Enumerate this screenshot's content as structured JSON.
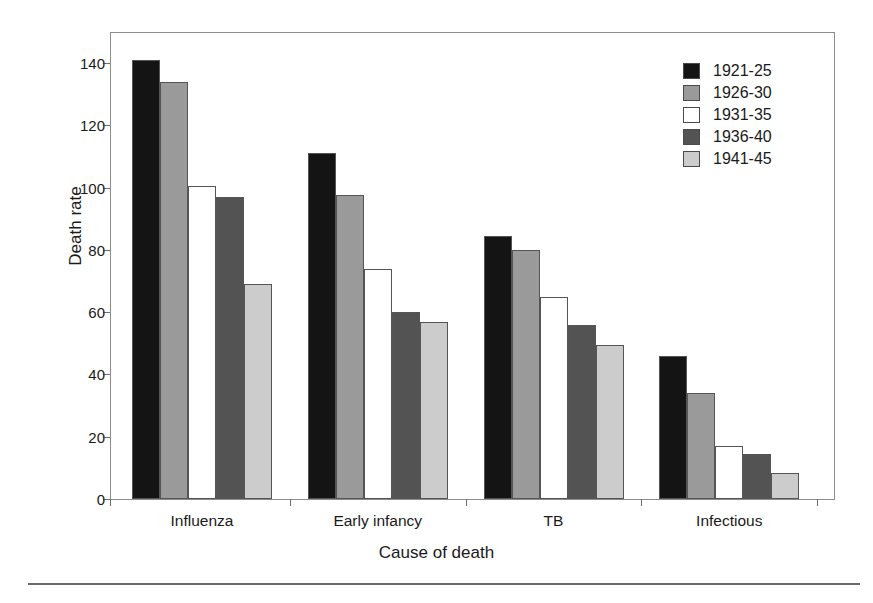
{
  "chart_data": {
    "type": "bar",
    "title": "",
    "xlabel": "Cause of death",
    "ylabel": "Death rate",
    "categories": [
      "Influenza",
      "Early infancy",
      "TB",
      "Infectious"
    ],
    "series": [
      {
        "name": "1921-25",
        "color": "#141414",
        "values": [
          141,
          111,
          84.5,
          46
        ]
      },
      {
        "name": "1926-30",
        "color": "#9a9a9a",
        "values": [
          134,
          97.5,
          80,
          34
        ]
      },
      {
        "name": "1931-35",
        "color": "#ffffff",
        "values": [
          100.5,
          74,
          65,
          17
        ]
      },
      {
        "name": "1936-40",
        "color": "#535353",
        "values": [
          97,
          60,
          56,
          14.5
        ]
      },
      {
        "name": "1941-45",
        "color": "#cccccc",
        "values": [
          69,
          57,
          49.5,
          8.5
        ]
      }
    ],
    "ylim": [
      0,
      140
    ],
    "yticks": [
      0,
      20,
      40,
      60,
      80,
      100,
      120,
      140
    ],
    "ytick_labels": [
      "0",
      "20",
      "40",
      "60",
      "80",
      "100",
      "120",
      "140"
    ],
    "grid": false,
    "legend_position": "top-right"
  },
  "axes": {
    "y_title": "Death rate",
    "x_title": "Cause of death"
  },
  "legend": {
    "entries": [
      {
        "label": "1921-25"
      },
      {
        "label": "1926-30"
      },
      {
        "label": "1931-35"
      },
      {
        "label": "1936-40"
      },
      {
        "label": "1941-45"
      }
    ]
  }
}
